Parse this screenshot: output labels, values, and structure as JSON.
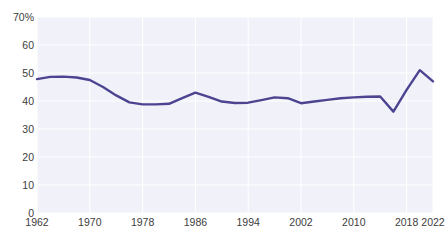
{
  "chart_title": "",
  "footnote": "",
  "colors": {
    "line": "#4c4490",
    "plot_background": "#f1f2f9",
    "gridline": "#ffffff",
    "tick_text": "#3d3d3d",
    "page_background": "#ffffff"
  },
  "axis": {
    "y_ticks": [
      "70%",
      "60",
      "50",
      "40",
      "30",
      "20",
      "10",
      "0"
    ],
    "x_ticks": [
      "1962",
      "1970",
      "1978",
      "1986",
      "1994",
      "2002",
      "2010",
      "2018",
      "2022"
    ]
  },
  "chart_data": {
    "type": "line",
    "title": "",
    "xlabel": "",
    "ylabel": "",
    "ylim": [
      0,
      70
    ],
    "xlim": [
      1962,
      2022
    ],
    "grid": true,
    "legend": "none",
    "yticklabels": [
      "70%",
      "60",
      "50",
      "40",
      "30",
      "20",
      "10",
      "0"
    ],
    "ytickvalues": [
      70,
      60,
      50,
      40,
      30,
      20,
      10,
      0
    ],
    "xticklabels": [
      "1962",
      "1970",
      "1978",
      "1986",
      "1994",
      "2002",
      "2010",
      "2018",
      "2022"
    ],
    "xtickvalues": [
      1962,
      1970,
      1978,
      1986,
      1994,
      2002,
      2010,
      2018,
      2022
    ],
    "series": [
      {
        "name": "",
        "color": "#4c4490",
        "x": [
          1962,
          1964,
          1966,
          1968,
          1970,
          1972,
          1974,
          1976,
          1978,
          1980,
          1982,
          1984,
          1986,
          1988,
          1990,
          1992,
          1994,
          1996,
          1998,
          2000,
          2002,
          2004,
          2006,
          2008,
          2010,
          2012,
          2014,
          2016,
          2018,
          2020,
          2022
        ],
        "values": [
          47.8,
          48.6,
          48.7,
          48.4,
          47.5,
          45.0,
          42.0,
          39.5,
          38.8,
          38.8,
          39.0,
          41.0,
          43.0,
          41.5,
          39.8,
          39.3,
          39.4,
          40.3,
          41.3,
          41.0,
          39.2,
          39.8,
          40.4,
          41.0,
          41.3,
          41.5,
          41.6,
          36.2,
          44.0,
          51.0,
          47.0
        ]
      }
    ]
  }
}
